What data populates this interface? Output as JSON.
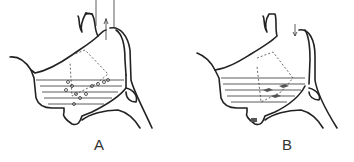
{
  "figure": {
    "panels": [
      {
        "label": "A",
        "description": "sagittal section with liquid and bubbles, arrows upward at nasopharynx"
      },
      {
        "label": "B",
        "description": "sagittal section with liquid, shaded residue, arrow downward at nasopharynx"
      }
    ]
  }
}
